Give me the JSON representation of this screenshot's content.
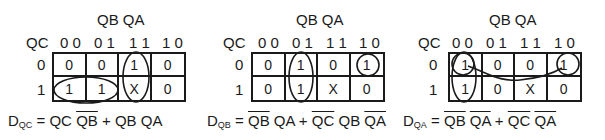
{
  "maps": [
    {
      "col_var": "QB QA",
      "row_var": "QC",
      "col_headers": [
        "0 0",
        "0 1",
        "1 1",
        "1 0"
      ],
      "row_headers": [
        "0",
        "1"
      ],
      "cells": [
        [
          "0",
          "0",
          "1",
          "0"
        ],
        [
          "1",
          "1",
          "X",
          "0"
        ]
      ],
      "equation": {
        "lhs_main": "D",
        "lhs_sub": "QC",
        "eq": " = ",
        "terms": [
          {
            "parts": [
              {
                "t": "QC",
                "bar": false
              },
              {
                "t": " ",
                "bar": false
              },
              {
                "t": "QB",
                "bar": true
              }
            ]
          },
          {
            "parts": [
              {
                "t": "QB",
                "bar": false
              },
              {
                "t": " ",
                "bar": false
              },
              {
                "t": "QA",
                "bar": false
              }
            ]
          }
        ],
        "plus": " + "
      }
    },
    {
      "col_var": "QB QA",
      "row_var": "QC",
      "col_headers": [
        "0 0",
        "0 1",
        "1 1",
        "1 0"
      ],
      "row_headers": [
        "0",
        "1"
      ],
      "cells": [
        [
          "0",
          "1",
          "0",
          "1"
        ],
        [
          "0",
          "1",
          "X",
          "0"
        ]
      ],
      "equation": {
        "lhs_main": "D",
        "lhs_sub": "QB",
        "eq": " = ",
        "terms": [
          {
            "parts": [
              {
                "t": "QB",
                "bar": true
              },
              {
                "t": " ",
                "bar": false
              },
              {
                "t": "QA",
                "bar": false
              }
            ]
          },
          {
            "parts": [
              {
                "t": "QC",
                "bar": true
              },
              {
                "t": " ",
                "bar": false
              },
              {
                "t": "QB",
                "bar": false
              },
              {
                "t": " ",
                "bar": false
              },
              {
                "t": "QA",
                "bar": true
              }
            ]
          }
        ],
        "plus": " + "
      }
    },
    {
      "col_var": "QB QA",
      "row_var": "QC",
      "col_headers": [
        "0 0",
        "0 1",
        "1 1",
        "1 0"
      ],
      "row_headers": [
        "0",
        "1"
      ],
      "cells": [
        [
          "1",
          "0",
          "0",
          "1"
        ],
        [
          "1",
          "0",
          "X",
          "0"
        ]
      ],
      "equation": {
        "lhs_main": "D",
        "lhs_sub": "QA",
        "eq": " = ",
        "terms": [
          {
            "parts": [
              {
                "t": "QB",
                "bar": true
              },
              {
                "t": " ",
                "bar": false
              },
              {
                "t": "QA",
                "bar": true
              }
            ]
          },
          {
            "parts": [
              {
                "t": "QC",
                "bar": true
              },
              {
                "t": " ",
                "bar": false
              },
              {
                "t": "QA",
                "bar": true
              }
            ]
          }
        ],
        "plus": " + "
      }
    }
  ],
  "style": {
    "line_color": "#1a1a1a",
    "background": "#ffffff"
  }
}
